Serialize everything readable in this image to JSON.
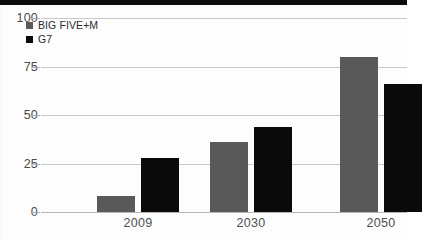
{
  "chart_data": {
    "type": "bar",
    "title": "",
    "subtitle": "",
    "xlabel": "",
    "ylabel": "",
    "categories": [
      "2009",
      "2030",
      "2050"
    ],
    "series": [
      {
        "name": "BIG FIVE+M",
        "color": "#595959",
        "values": [
          8,
          36,
          80
        ]
      },
      {
        "name": "G7",
        "color": "#0a0a0a",
        "values": [
          28,
          44,
          66
        ]
      }
    ],
    "ylim": [
      0,
      100
    ],
    "y_ticks": [
      0,
      25,
      50,
      75,
      100
    ],
    "y_tick_labels": [
      "0",
      "25",
      "50",
      "75",
      "100"
    ],
    "grid": true,
    "grid_axis": "y",
    "legend_position": "top-left"
  },
  "legend": {
    "items": [
      {
        "label": "BIG FIVE+M",
        "swatch": "legend-swatch-gray"
      },
      {
        "label": "G7",
        "swatch": "legend-swatch-black"
      }
    ]
  }
}
